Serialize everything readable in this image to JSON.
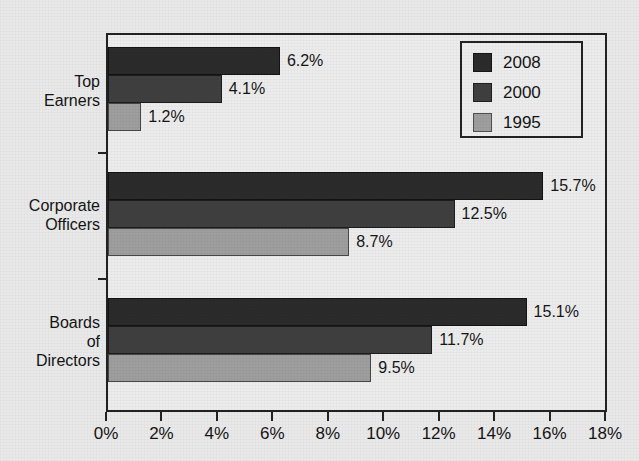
{
  "chart_data": {
    "type": "bar",
    "orientation": "horizontal",
    "title": "",
    "subtitle": "",
    "xlabel": "",
    "ylabel": "",
    "categories": [
      "Top Earners",
      "Corporate Officers",
      "Boards of Directors"
    ],
    "category_lines": [
      [
        "Top",
        "Earners"
      ],
      [
        "Corporate",
        "Officers"
      ],
      [
        "Boards",
        "of",
        "Directors"
      ]
    ],
    "series": [
      {
        "name": "2008",
        "color": "#2b2b2b",
        "values": [
          6.2,
          15.7,
          15.1
        ],
        "labels": [
          "6.2%",
          "15.7%",
          "15.1%"
        ]
      },
      {
        "name": "2000",
        "color": "#3f3f3f",
        "values": [
          4.1,
          12.5,
          11.7
        ],
        "labels": [
          "4.1%",
          "12.5%",
          "11.7%"
        ]
      },
      {
        "name": "1995",
        "color": "#9e9e9e",
        "values": [
          1.2,
          8.7,
          9.5
        ],
        "labels": [
          "1.2%",
          "8.7%",
          "9.5%"
        ]
      }
    ],
    "xlim": [
      0,
      18
    ],
    "xticks": [
      0,
      2,
      4,
      6,
      8,
      10,
      12,
      14,
      16,
      18
    ],
    "xtick_labels": [
      "0%",
      "2%",
      "4%",
      "6%",
      "8%",
      "10%",
      "12%",
      "14%",
      "16%",
      "18%"
    ],
    "grid": false,
    "legend_position": "top-right",
    "legend_entries": [
      "2008",
      "2000",
      "1995"
    ],
    "value_suffix": "%"
  },
  "legend": {
    "items": [
      {
        "label": "2008"
      },
      {
        "label": "2000"
      },
      {
        "label": "1995"
      }
    ]
  },
  "axis": {
    "x_tick_labels": [
      "0%",
      "2%",
      "4%",
      "6%",
      "8%",
      "10%",
      "12%",
      "14%",
      "16%",
      "18%"
    ]
  },
  "categories": [
    {
      "lines": [
        "Top",
        "Earners"
      ]
    },
    {
      "lines": [
        "Corporate",
        "Officers"
      ]
    },
    {
      "lines": [
        "Boards",
        "of",
        "Directors"
      ]
    }
  ],
  "bar_labels": {
    "g0": [
      "6.2%",
      "4.1%",
      "1.2%"
    ],
    "g1": [
      "15.7%",
      "12.5%",
      "8.7%"
    ],
    "g2": [
      "15.1%",
      "11.7%",
      "9.5%"
    ]
  }
}
